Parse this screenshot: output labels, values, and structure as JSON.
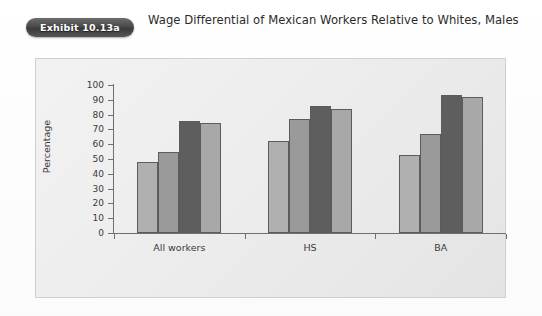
{
  "header": {
    "badge_label": "Exhibit 10.13a",
    "title": "Wage Differential of Mexican Workers Relative to Whites, Males"
  },
  "chart_data": {
    "type": "bar",
    "title": "Wage Differential of Mexican Workers Relative to Whites, Males",
    "xlabel": "",
    "ylabel": "Percentage",
    "ylim": [
      0,
      100
    ],
    "yticks": [
      0,
      10,
      20,
      30,
      40,
      50,
      60,
      70,
      80,
      90,
      100
    ],
    "ytick_labels": [
      "0",
      "10",
      "20",
      "30",
      "40",
      "50",
      "60",
      "70",
      "80",
      "90",
      "100"
    ],
    "grid": false,
    "legend_position": "bottom-center",
    "categories": [
      "All workers",
      "HS",
      "BA"
    ],
    "series": [
      {
        "name": "Recent Immigrants",
        "color": "#b0b0b0",
        "values": [
          48,
          62,
          53
        ]
      },
      {
        "name": "Earlier Immigrants",
        "color": "#9a9a9a",
        "values": [
          55,
          77,
          67
        ]
      },
      {
        "name": "Second Generation",
        "color": "#5e5e5e",
        "values": [
          76,
          86,
          93
        ]
      },
      {
        "name": "Third + Generation",
        "color": "#a8a8a8",
        "values": [
          74,
          84,
          92
        ]
      }
    ]
  },
  "colors": {
    "panel_background": "#eeeeee",
    "panel_border": "#cfcfcf",
    "axis": "#6f6f6f",
    "bar_outline": "#5c5c5c",
    "legend_background": "#e7e7e7",
    "badge_background": "#4a4a4a"
  }
}
